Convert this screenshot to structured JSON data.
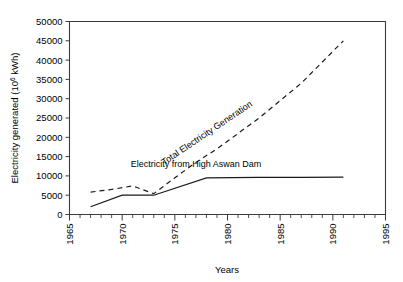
{
  "chart_data": {
    "type": "line",
    "title": "",
    "xlabel": "Years",
    "ylabel": "Electricity generated (10⁶ kWh)",
    "ylabel_base": "Electricity generated (10",
    "ylabel_exp": "6",
    "ylabel_tail": " kWh)",
    "xlim": [
      1965,
      1995
    ],
    "ylim": [
      0,
      50000
    ],
    "grid": false,
    "legend": "inline-annotations",
    "x_ticks": [
      1965,
      1970,
      1975,
      1980,
      1985,
      1990,
      1995
    ],
    "x_tick_labels": [
      "1965",
      "1970",
      "1975",
      "1980",
      "1985",
      "1990",
      "1995"
    ],
    "x_minor_tick_step": 1,
    "y_ticks": [
      0,
      5000,
      10000,
      15000,
      20000,
      25000,
      30000,
      35000,
      40000,
      45000,
      50000
    ],
    "y_tick_labels": [
      "0",
      "5000",
      "10000",
      "15000",
      "20000",
      "25000",
      "30000",
      "35000",
      "40000",
      "45000",
      "50000"
    ],
    "series": [
      {
        "name": "Total Electricity Generation",
        "style": "dashed",
        "color": "#1a1a1a",
        "annotation": "Total Electricity Generation",
        "x": [
          1967,
          1969,
          1971,
          1973,
          1975,
          1977,
          1979,
          1981,
          1983,
          1985,
          1987,
          1989,
          1991
        ],
        "values": [
          5800,
          6500,
          7400,
          5400,
          9500,
          13500,
          17000,
          21000,
          25000,
          29500,
          34000,
          39500,
          45000
        ]
      },
      {
        "name": "Electricity from High Aswan Dam",
        "style": "solid",
        "color": "#1a1a1a",
        "annotation": "Electricity from High Aswan Dam",
        "x": [
          1967,
          1970,
          1973,
          1978,
          1983,
          1987,
          1991
        ],
        "values": [
          2000,
          5000,
          5000,
          9500,
          9600,
          9600,
          9700
        ]
      }
    ],
    "annotations": [
      {
        "text": "Total Electricity Generation",
        "rotation": -34,
        "x": 1978.2,
        "y": 20500
      },
      {
        "text": "Electricity from High Aswan Dam",
        "rotation": 0,
        "x": 1977.0,
        "y": 12300
      }
    ]
  }
}
